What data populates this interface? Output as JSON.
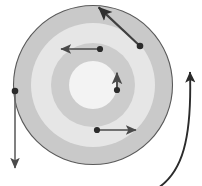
{
  "figure": {
    "caption": "",
    "canvas": {
      "width": 202,
      "height": 186,
      "background": "#ffffff"
    }
  },
  "colors": {
    "outer_band": "#c9c9c9",
    "second_band": "#e4e4e4",
    "third_band": "#cccccc",
    "core": "#f2f2f2",
    "circle_stroke": "#5a5a5a",
    "vector_stroke": "#4a4a4a",
    "rotation_stroke": "#333333",
    "dot_fill": "#2b2b2b"
  },
  "geometry": {
    "center": {
      "x": 93,
      "y": 85
    },
    "rings": [
      {
        "name": "outer-band",
        "radius": 80,
        "fill": "#c9c9c9"
      },
      {
        "name": "second-band",
        "radius": 62,
        "fill": "#e4e4e4"
      },
      {
        "name": "third-band",
        "radius": 42,
        "fill": "#cbcbcb"
      },
      {
        "name": "core-disk",
        "radius": 24,
        "fill": "#f2f2f2"
      }
    ]
  },
  "vectors": [
    {
      "name": "vector-upper-left",
      "label": "",
      "origin": {
        "x": 100,
        "y": 49
      },
      "tip": {
        "x": 56,
        "y": 49
      },
      "direction": "left",
      "length": 44
    },
    {
      "name": "vector-center-up",
      "label": "",
      "origin": {
        "x": 117,
        "y": 90
      },
      "tip": {
        "x": 117,
        "y": 69
      },
      "direction": "up",
      "length": 21
    },
    {
      "name": "vector-lower-right",
      "label": "",
      "origin": {
        "x": 97,
        "y": 130
      },
      "tip": {
        "x": 141,
        "y": 130
      },
      "direction": "right",
      "length": 44
    },
    {
      "name": "vector-left-down",
      "label": "",
      "origin": {
        "x": 15,
        "y": 91
      },
      "tip": {
        "x": 15,
        "y": 173
      },
      "direction": "down",
      "length": 82
    },
    {
      "name": "vector-upper-right-diagonal",
      "label": "",
      "origin": {
        "x": 140,
        "y": 46
      },
      "tip": {
        "x": 95,
        "y": 4
      },
      "direction": "up-left",
      "length": 62
    }
  ],
  "rotation_arrow": {
    "name": "rotation-direction-arc",
    "label": "",
    "sense": "counterclockwise",
    "start": {
      "x": 158,
      "y": 186
    },
    "end": {
      "x": 189,
      "y": 63
    }
  }
}
